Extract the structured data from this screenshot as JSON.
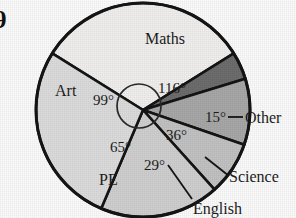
{
  "question_number": "9",
  "chart_data": {
    "type": "pie",
    "title": "",
    "categories": [
      "Maths",
      "Other",
      "Science",
      "English",
      "PE",
      "Art"
    ],
    "values": [
      116,
      15,
      36,
      29,
      65,
      99
    ],
    "value_unit": "degrees",
    "total": 360,
    "angle_labels": [
      "116°",
      "15°",
      "36°",
      "29°",
      "65°",
      "99°"
    ],
    "legend": "none",
    "grid": false,
    "slices": [
      {
        "label": "Maths",
        "angle": 116,
        "angle_label": "116°",
        "color": "#f0efed",
        "label_placement": "inside",
        "leader_line": false
      },
      {
        "label": "Other",
        "angle": 15,
        "angle_label": "15°",
        "color": "#6d6d6d",
        "label_placement": "outside",
        "leader_line": true
      },
      {
        "label": "Science",
        "angle": 36,
        "angle_label": "36°",
        "color": "#a8a8a8",
        "label_placement": "outside",
        "leader_line": true
      },
      {
        "label": "English",
        "angle": 29,
        "angle_label": "29°",
        "color": "#c2c2c2",
        "label_placement": "outside",
        "leader_line": true
      },
      {
        "label": "PE",
        "angle": 65,
        "angle_label": "65°",
        "color": "#cfcfcf",
        "label_placement": "inside",
        "leader_line": false
      },
      {
        "label": "Art",
        "angle": 99,
        "angle_label": "99°",
        "color": "#dcdcdc",
        "label_placement": "inside",
        "leader_line": false
      }
    ],
    "colors": {
      "outline": "#151515",
      "maths": "#f0efed",
      "other": "#6d6d6d",
      "science": "#a8a8a8",
      "english": "#c2c2c2",
      "pe": "#cfcfcf",
      "art": "#dcdcdc",
      "background": "#fbfbfb"
    }
  },
  "labels": {
    "maths": "Maths",
    "art": "Art",
    "pe": "PE",
    "english": "English",
    "science": "Science",
    "other": "Other"
  },
  "angles": {
    "maths": "116°",
    "art": "99°",
    "pe": "65°",
    "english": "29°",
    "science": "36°",
    "other": "15°"
  }
}
